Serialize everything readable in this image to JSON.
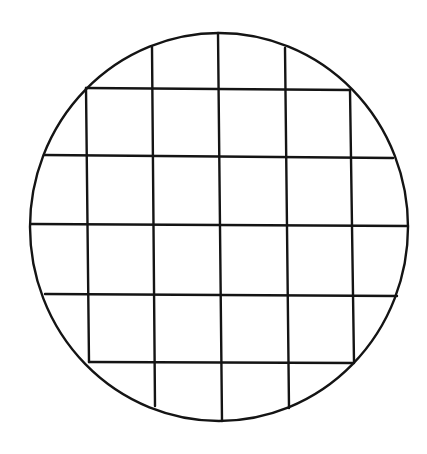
{
  "diagram": {
    "type": "circle-with-square-grid",
    "colors": {
      "background": "#ffffff",
      "stroke": "#141414"
    },
    "circle": {
      "cx": 219,
      "cy": 227,
      "rx": 189,
      "ry": 194
    },
    "grid": {
      "vertical_lines": [
        {
          "x1": 86,
          "y1": 88,
          "x2": 89,
          "y2": 362
        },
        {
          "x1": 152,
          "y1": 47,
          "x2": 155,
          "y2": 406
        },
        {
          "x1": 218,
          "y1": 33,
          "x2": 222,
          "y2": 421
        },
        {
          "x1": 285,
          "y1": 48,
          "x2": 289,
          "y2": 408
        },
        {
          "x1": 350,
          "y1": 90,
          "x2": 354,
          "y2": 362
        }
      ],
      "horizontal_lines": [
        {
          "x1": 86,
          "y1": 88,
          "x2": 350,
          "y2": 90
        },
        {
          "x1": 44,
          "y1": 155,
          "x2": 393,
          "y2": 158
        },
        {
          "x1": 31,
          "y1": 224,
          "x2": 408,
          "y2": 226
        },
        {
          "x1": 45,
          "y1": 294,
          "x2": 397,
          "y2": 296
        },
        {
          "x1": 89,
          "y1": 362,
          "x2": 354,
          "y2": 363
        }
      ],
      "cell_count_full": 16
    }
  }
}
